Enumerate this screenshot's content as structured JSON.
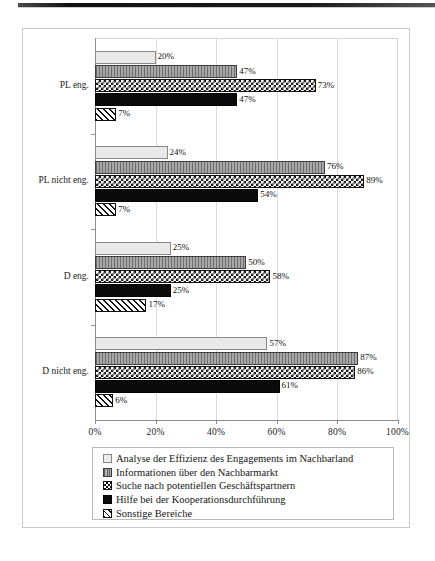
{
  "chart_data": {
    "type": "bar",
    "orientation": "horizontal",
    "title": "",
    "xlabel": "",
    "ylabel": "",
    "xlim": [
      0,
      100
    ],
    "xticks": [
      "0%",
      "20%",
      "40%",
      "60%",
      "80%",
      "100%"
    ],
    "xtick_values": [
      0,
      20,
      40,
      60,
      80,
      100
    ],
    "grid": true,
    "grid_axis": "x",
    "legend_position": "bottom",
    "categories": [
      "PL eng.",
      "PL nicht eng.",
      "D eng.",
      "D nicht eng."
    ],
    "series": [
      {
        "name": "Analyse der Effizienz des Engagements im Nachbarland",
        "pattern": "light-dotted",
        "values": [
          20,
          24,
          25,
          57
        ],
        "labels": [
          "20%",
          "24%",
          "25%",
          "57%"
        ]
      },
      {
        "name": "Informationen über den Nachbarmarkt",
        "pattern": "vertical-stripes",
        "values": [
          47,
          76,
          50,
          87
        ],
        "labels": [
          "47%",
          "76%",
          "50%",
          "87%"
        ]
      },
      {
        "name": "Suche nach potentiellen Geschäftspartnern",
        "pattern": "checkerboard",
        "values": [
          73,
          89,
          58,
          86
        ],
        "labels": [
          "73%",
          "89%",
          "58%",
          "86%"
        ]
      },
      {
        "name": "Hilfe bei der Kooperationsdurchführung",
        "pattern": "solid-black",
        "values": [
          47,
          54,
          25,
          61
        ],
        "labels": [
          "47%",
          "54%",
          "25%",
          "61%"
        ]
      },
      {
        "name": "Sonstige Bereiche",
        "pattern": "diagonal-hatch",
        "values": [
          7,
          7,
          17,
          6
        ],
        "labels": [
          "7%",
          "7%",
          "17%",
          "6%"
        ]
      }
    ]
  },
  "legend": {
    "items": [
      "Analyse der Effizienz des Engagements im Nachbarland",
      "Informationen über den Nachbarmarkt",
      "Suche nach potentiellen Geschäftspartnern",
      "Hilfe bei der Kooperationsdurchführung",
      "Sonstige Bereiche"
    ]
  },
  "colors": {
    "axis": "#8d8d8d",
    "grid": "#dcdcdc",
    "frame": "#c9c9c9",
    "text": "#1b1b1b",
    "series_solid": "#0a0a0a"
  }
}
